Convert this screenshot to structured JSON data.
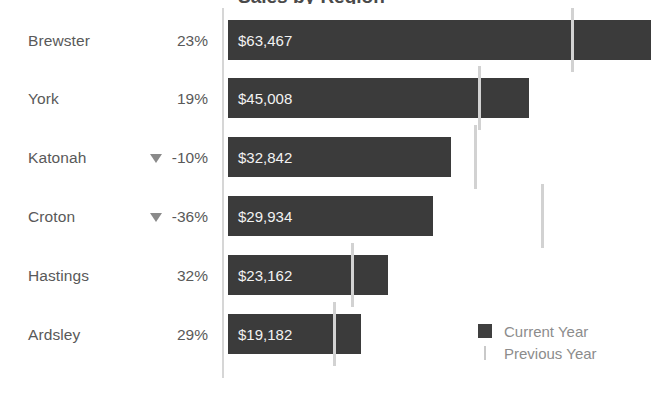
{
  "chart_data": {
    "type": "bar",
    "title": "Sales by Region",
    "orientation": "horizontal",
    "xlabel": "",
    "ylabel": "",
    "grid": false,
    "legend_position": "bottom-right",
    "categories": [
      "Brewster",
      "York",
      "Katonah",
      "Croton",
      "Hastings",
      "Ardsley"
    ],
    "series": [
      {
        "name": "Current Year",
        "color": "#3b3b3b",
        "values": [
          63467,
          45008,
          32842,
          29934,
          23162,
          19182
        ],
        "value_labels": [
          "$63,467",
          "$45,008",
          "$32,842",
          "$29,934",
          "$23,162",
          "$19,182"
        ]
      },
      {
        "name": "Previous Year",
        "color": "#d2d2d2",
        "values": [
          51599,
          37822,
          36491,
          46772,
          17547,
          14870
        ]
      }
    ],
    "delta_labels": [
      "23%",
      "19%",
      "-10%",
      "-36%",
      "32%",
      "29%"
    ],
    "delta_negative": [
      false,
      false,
      true,
      true,
      false,
      false
    ],
    "xlim": [
      0,
      69000
    ]
  },
  "rows": [
    {
      "name": "Brewster",
      "delta": "23%",
      "negative": false,
      "value_label": "$63,467",
      "bar_end_px": 423,
      "marker_px": 343
    },
    {
      "name": "York",
      "delta": "19%",
      "negative": false,
      "value_label": "$45,008",
      "bar_end_px": 301,
      "marker_px": 250
    },
    {
      "name": "Katonah",
      "delta": "-10%",
      "negative": true,
      "value_label": "$32,842",
      "bar_end_px": 223,
      "marker_px": 246
    },
    {
      "name": "Croton",
      "delta": "-36%",
      "negative": true,
      "value_label": "$29,934",
      "bar_end_px": 205,
      "marker_px": 313
    },
    {
      "name": "Hastings",
      "delta": "32%",
      "negative": false,
      "value_label": "$23,162",
      "bar_end_px": 160,
      "marker_px": 123
    },
    {
      "name": "Ardsley",
      "delta": "29%",
      "negative": false,
      "value_label": "$19,182",
      "bar_end_px": 133,
      "marker_px": 105
    }
  ],
  "legend": {
    "current_label": "Current Year",
    "previous_label": "Previous Year"
  },
  "colors": {
    "bar": "#3b3b3b",
    "marker": "#d2d2d2",
    "axis": "#d6d6d6",
    "text": "#595959",
    "value_text": "#f2f2f2"
  }
}
